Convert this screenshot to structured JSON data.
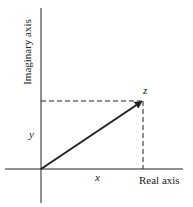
{
  "diagram": {
    "type": "complex-plane",
    "axes": {
      "horizontal_label": "Real axis",
      "vertical_label": "Imaginary axis"
    },
    "point": {
      "label": "z"
    },
    "components": {
      "x_label": "x",
      "y_label": "y"
    },
    "colors": {
      "ink": "#222222",
      "background": "#ffffff"
    }
  }
}
